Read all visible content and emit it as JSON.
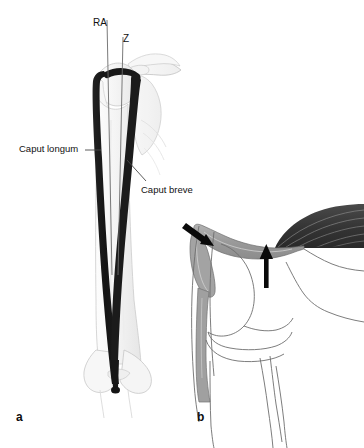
{
  "figure": {
    "background_color": "#ffffff"
  },
  "panels": [
    {
      "letter": "a",
      "name": "panel-a-frontal-view",
      "description": "Frontal view of shoulder and arm skeleton with biceps brachii muscle shown dark; two vertical reference axes labelled RA and Z."
    },
    {
      "letter": "b",
      "name": "panel-b-lateral-view",
      "description": "Lateral view of joint with striated muscle, gray tendon and two black arrows indicating insertion sites."
    }
  ],
  "panel_a": {
    "letter": "a",
    "axes": [
      {
        "id": "ra",
        "label": "RA"
      },
      {
        "id": "z",
        "label": "Z"
      }
    ],
    "annotations": [
      {
        "id": "caput-longum",
        "label": "Caput longum"
      },
      {
        "id": "caput-breve",
        "label": "Caput breve"
      }
    ]
  },
  "panel_b": {
    "letter": "b",
    "arrows": [
      {
        "id": "arrow-diagonal",
        "direction": "down-right",
        "description": "points to tendon insertion on gray structure"
      },
      {
        "id": "arrow-vertical",
        "direction": "up",
        "description": "points up to underside of tendon"
      }
    ]
  },
  "colors": {
    "muscle_dark": "#1c1c1c",
    "muscle_striated": "#3c3c3c",
    "striation_line": "#8c8c8c",
    "tendon_gray": "#9a9a9a",
    "bone_outline": "#8a8a8a",
    "bone_fill_faint": "#f2f2f2",
    "bone_fill_light": "#fcfcfc",
    "leader_line": "#4a4a4a",
    "axis_line": "#6b6b6b",
    "text": "#111111",
    "background": "#ffffff"
  }
}
